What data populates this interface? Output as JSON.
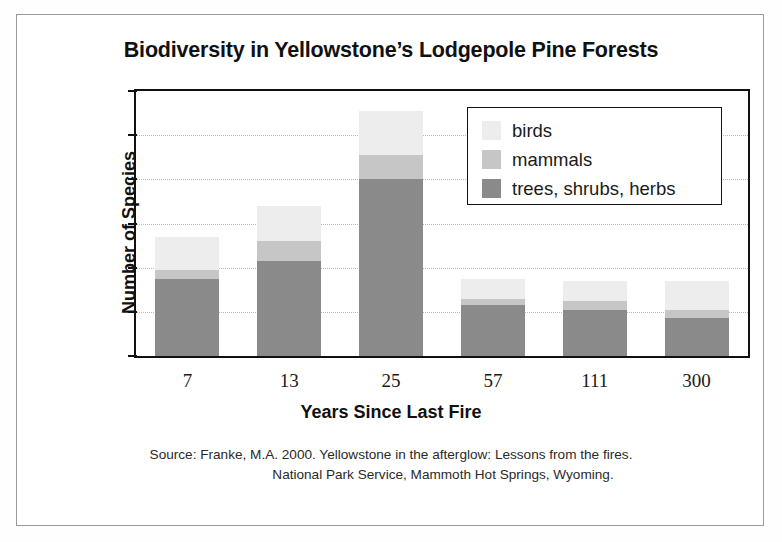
{
  "chart_data": {
    "type": "bar",
    "subtype": "stacked-bar",
    "title": "Biodiversity in Yellowstone’s Lodgepole Pine Forests",
    "xlabel": "Years Since Last Fire",
    "ylabel": "Number of Species",
    "categories": [
      "7",
      "13",
      "25",
      "57",
      "111",
      "300"
    ],
    "series": [
      {
        "name": "trees, shrubs, herbs",
        "color": "#8a8a8a",
        "values": [
          35,
          43,
          80,
          23,
          21,
          17
        ]
      },
      {
        "name": "mammals",
        "color": "#c6c6c6",
        "values": [
          4,
          9,
          11,
          3,
          4,
          4
        ]
      },
      {
        "name": "birds",
        "color": "#ededed",
        "values": [
          15,
          16,
          20,
          9,
          9,
          13
        ]
      }
    ],
    "totals": [
      54,
      68,
      111,
      35,
      34,
      34
    ],
    "ylim": [
      0,
      120
    ],
    "yticks": [
      0,
      20,
      40,
      60,
      80,
      100,
      120
    ],
    "ytick_labels": [
      "0",
      "20",
      "40",
      "60",
      "80",
      "100",
      "120"
    ],
    "grid": true,
    "grid_style": "dotted-horizontal",
    "legend_position": "top-right-inside",
    "legend_entries": [
      "birds",
      "mammals",
      "trees, shrubs, herbs"
    ]
  },
  "source": {
    "line1": "Source: Franke, M.A. 2000. Yellowstone in the afterglow: Lessons from the fires.",
    "line2": "National Park Service, Mammoth Hot Springs, Wyoming."
  },
  "colors": {
    "birds": "#ededed",
    "mammals": "#c6c6c6",
    "trees": "#8a8a8a",
    "axis": "#111111",
    "grid": "#b9b9b9",
    "page_border": "#9a9a9a"
  }
}
